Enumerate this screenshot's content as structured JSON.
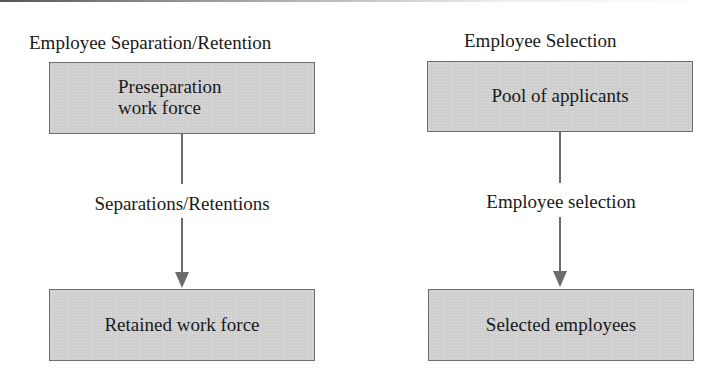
{
  "diagrams": [
    {
      "title": "Employee Separation/Retention",
      "top_box": {
        "line1": "Preseparation",
        "line2": "work force"
      },
      "process_label": "Separations/Retentions",
      "bottom_box": {
        "label": "Retained work force"
      }
    },
    {
      "title": "Employee Selection",
      "top_box": {
        "label": "Pool of applicants"
      },
      "process_label": "Employee selection",
      "bottom_box": {
        "label": "Selected employees"
      }
    }
  ],
  "colors": {
    "box_fill": "#cfcfcf",
    "box_border": "#6e6e6e",
    "connector": "#6b6b6b",
    "text": "#1a1a1a"
  }
}
